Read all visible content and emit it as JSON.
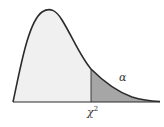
{
  "diagram": {
    "labels": {
      "alpha": "α",
      "critical_value": "χ",
      "critical_value_exponent": "2"
    },
    "colors": {
      "curve": "#2b2b2b",
      "body_fill": "#f0f0f0",
      "tail_fill": "#a6a6a6",
      "baseline": "#2b2b2b",
      "divider": "#2b2b2b",
      "background": "#ffffff"
    }
  }
}
